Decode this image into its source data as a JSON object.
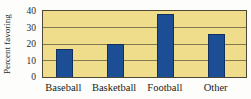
{
  "figure": {
    "background": "#fdfdfb",
    "plot_bg": "#f0dd8b",
    "bar_fill": "#1c4e96",
    "bar_border": "#122f5e",
    "grid_color": "#6e6847",
    "frame_color": "#4d4936",
    "text_color": "#2a2a28"
  },
  "chart_data": {
    "type": "bar",
    "title": "",
    "xlabel": "",
    "ylabel": "Percent favoring",
    "categories": [
      "Baseball",
      "Basketball",
      "Football",
      "Other"
    ],
    "values": [
      17,
      20,
      38,
      26
    ],
    "ylim": [
      0,
      40
    ],
    "yticks": [
      0,
      10,
      20,
      30,
      40
    ],
    "grid": "horizontal",
    "legend": "none"
  }
}
